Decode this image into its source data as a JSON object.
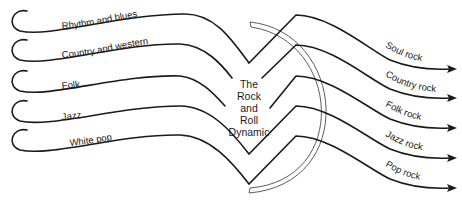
{
  "diagram": {
    "title": "The Rock and Roll Dynamic",
    "center_lines": [
      "The",
      "Rock",
      "and",
      "Roll",
      "Dynamic"
    ],
    "inputs": [
      {
        "label": "Rhythm and blues"
      },
      {
        "label": "Country and western"
      },
      {
        "label": "Folk"
      },
      {
        "label": "Jazz"
      },
      {
        "label": "White pop"
      }
    ],
    "outputs": [
      {
        "label": "Soul rock"
      },
      {
        "label": "Country rock"
      },
      {
        "label": "Folk rock"
      },
      {
        "label": "Jazz rock"
      },
      {
        "label": "Pop rock"
      }
    ],
    "flows": [
      {
        "from": "Rhythm and blues",
        "to": "Soul rock"
      },
      {
        "from": "Country and western",
        "to": "Country rock"
      },
      {
        "from": "Folk",
        "to": "Folk rock"
      },
      {
        "from": "Jazz",
        "to": "Jazz rock"
      },
      {
        "from": "White pop",
        "to": "Pop rock"
      }
    ],
    "colors": {
      "line": "#1a1a1a",
      "arc": "#4a4a4a",
      "background": "#ffffff"
    }
  }
}
